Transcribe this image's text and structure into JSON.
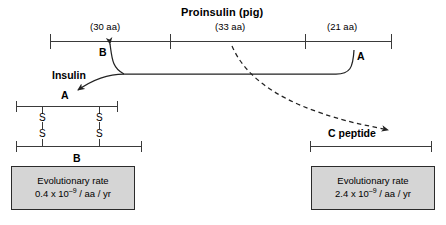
{
  "title": "Proinsulin (pig)",
  "proinsulin": {
    "segments": [
      {
        "length_label": "(30 aa)",
        "chain": "B"
      },
      {
        "length_label": "(33 aa)",
        "chain": "C"
      },
      {
        "length_label": "(21 aa)",
        "chain": "A"
      }
    ],
    "b_label": "B",
    "a_label": "A"
  },
  "insulin": {
    "label": "Insulin",
    "a_chain_label": "A",
    "b_chain_label": "B",
    "disulfide": {
      "s_top_left": "S",
      "s_bottom_left": "S",
      "s_top_right": "S",
      "s_bottom_right": "S"
    }
  },
  "c_peptide": {
    "label": "C peptide"
  },
  "rates": {
    "insulin": {
      "caption": "Evolutionary rate",
      "value_prefix": "0.4 x 10",
      "exponent": "–9",
      "value_suffix": " / aa / yr"
    },
    "c_peptide": {
      "caption": "Evolutionary rate",
      "value_prefix": "2.4 x 10",
      "exponent": "–9",
      "value_suffix": " / aa / yr"
    }
  },
  "colors": {
    "line": "#3a3a3a",
    "box_fill": "#d5d5d5",
    "box_border": "#2b2b2b",
    "text": "#000000",
    "background": "#ffffff"
  }
}
